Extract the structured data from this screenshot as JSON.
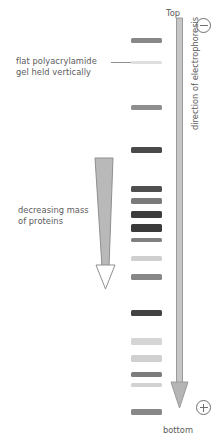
{
  "diagram": {
    "labels": {
      "gel_label": "flat polyacrylamide\ngel held vertically",
      "mass_label": "decreasing mass\nof proteins",
      "top_label": "Top",
      "bottom_label": "bottom",
      "direction_label": "direction of electrophoresis"
    },
    "electrodes": {
      "negative": {
        "name": "negative-electrode",
        "symbol": "⊖"
      },
      "positive": {
        "name": "positive-electrode",
        "symbol": "⊕"
      }
    },
    "colors": {
      "text": "#5b5b5b",
      "line": "#8d8d8d",
      "band_dark": "#3c3c3c",
      "band_mid": "#8a8a8a",
      "band_light": "#d8d8d8",
      "arrow_fill": "#b5b5b5",
      "background": "#ffffff"
    }
  },
  "chart_data": {
    "type": "gel-electrophoresis-lane",
    "title": "flat polyacrylamide gel held vertically",
    "xlabel": "",
    "ylabel": "direction of electrophoresis",
    "axis_top_label": "Top",
    "axis_bottom_label": "bottom",
    "lane_x": 131,
    "lane_width": 31,
    "bands": [
      {
        "id": 1,
        "y": 38,
        "height": 5,
        "intensity": 0.55,
        "color": "#888888"
      },
      {
        "id": 2,
        "y": 61,
        "height": 3,
        "intensity": 0.12,
        "color": "#dedede"
      },
      {
        "id": 3,
        "y": 105,
        "height": 5,
        "intensity": 0.52,
        "color": "#8e8e8e"
      },
      {
        "id": 4,
        "y": 147,
        "height": 6,
        "intensity": 0.82,
        "color": "#4a4a4a"
      },
      {
        "id": 5,
        "y": 186,
        "height": 6,
        "intensity": 0.8,
        "color": "#4f4f4f"
      },
      {
        "id": 6,
        "y": 198,
        "height": 6,
        "intensity": 0.6,
        "color": "#7a7a7a"
      },
      {
        "id": 7,
        "y": 211,
        "height": 7,
        "intensity": 0.88,
        "color": "#3c3c3c"
      },
      {
        "id": 8,
        "y": 224,
        "height": 8,
        "intensity": 0.9,
        "color": "#3a3a3a"
      },
      {
        "id": 9,
        "y": 238,
        "height": 4,
        "intensity": 0.58,
        "color": "#808080"
      },
      {
        "id": 10,
        "y": 256,
        "height": 5,
        "intensity": 0.22,
        "color": "#cfcfcf"
      },
      {
        "id": 11,
        "y": 274,
        "height": 6,
        "intensity": 0.55,
        "color": "#878787"
      },
      {
        "id": 12,
        "y": 310,
        "height": 6,
        "intensity": 0.85,
        "color": "#434343"
      },
      {
        "id": 13,
        "y": 338,
        "height": 7,
        "intensity": 0.2,
        "color": "#d5d5d5"
      },
      {
        "id": 14,
        "y": 355,
        "height": 7,
        "intensity": 0.22,
        "color": "#d0d0d0"
      },
      {
        "id": 15,
        "y": 372,
        "height": 5,
        "intensity": 0.6,
        "color": "#7d7d7d"
      },
      {
        "id": 16,
        "y": 383,
        "height": 4,
        "intensity": 0.22,
        "color": "#d2d2d2"
      },
      {
        "id": 17,
        "y": 409,
        "height": 6,
        "intensity": 0.55,
        "color": "#888888"
      }
    ]
  }
}
